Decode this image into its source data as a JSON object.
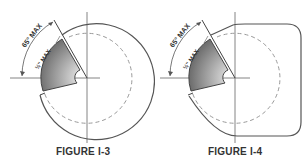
{
  "figures": [
    {
      "id": "I-3",
      "caption": "FIGURE I-3",
      "labels": {
        "angle": "65° MAX",
        "depth": "½\" MAX"
      },
      "shape": "circular"
    },
    {
      "id": "I-4",
      "caption": "FIGURE I-4",
      "labels": {
        "angle": "65° MAX",
        "depth": "½\" MAX"
      },
      "shape": "rounded-rectangular"
    }
  ],
  "colors": {
    "line": "#555555",
    "dash": "#999999",
    "shade_dark": "#777777",
    "shade_light": "#f2f2f2"
  }
}
